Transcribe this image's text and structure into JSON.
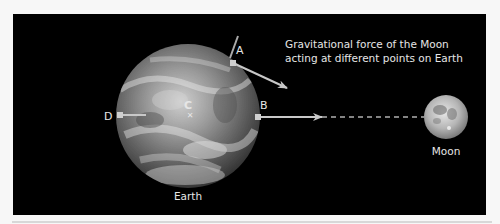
{
  "diagram": {
    "title_lines": [
      "Gravitational force of the Moon",
      "acting at different points on Earth"
    ],
    "bodies": {
      "earth": {
        "label": "Earth"
      },
      "moon": {
        "label": "Moon"
      }
    },
    "points": [
      {
        "id": "A",
        "label": "A"
      },
      {
        "id": "B",
        "label": "B"
      },
      {
        "id": "C",
        "label": "C"
      },
      {
        "id": "D",
        "label": "D"
      }
    ],
    "colors": {
      "background": "#000000",
      "text": "#e6e6e6",
      "arrow": "#c8c8c8"
    }
  }
}
